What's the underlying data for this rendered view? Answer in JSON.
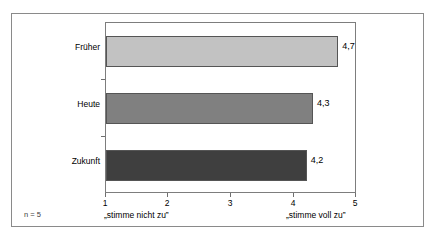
{
  "chart_data": {
    "type": "bar",
    "orientation": "horizontal",
    "title": "",
    "xlabel": "",
    "ylabel": "",
    "categories": [
      "Früher",
      "Heute",
      "Zukunft"
    ],
    "values": [
      4.7,
      4.3,
      4.2
    ],
    "value_labels": [
      "4,7",
      "4,3",
      "4,2"
    ],
    "bar_colors": [
      "#c2c2c2",
      "#808080",
      "#3f3f3f"
    ],
    "bar_border_color": "#555555",
    "xlim": [
      1,
      5
    ],
    "xticks": [
      1,
      2,
      3,
      4,
      5
    ],
    "xtick_labels": [
      "1",
      "2",
      "3",
      "4",
      "5"
    ],
    "grid": false,
    "legend": false,
    "scale_caption_left": "„stimme nicht zu”",
    "scale_caption_right": "„stimme voll zu”",
    "sample_size_note": "n = 5"
  }
}
